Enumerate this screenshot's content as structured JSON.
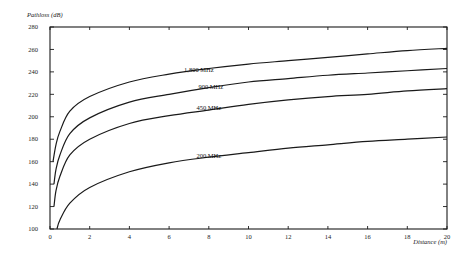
{
  "chart_data": {
    "type": "line",
    "title": "",
    "xlabel": "Distance (m)",
    "ylabel": "Pathloss (dB)",
    "xlim": [
      0,
      20
    ],
    "ylim": [
      100,
      280
    ],
    "x_ticks": [
      0,
      2,
      4,
      6,
      8,
      10,
      12,
      14,
      16,
      18,
      20
    ],
    "y_ticks": [
      100,
      120,
      140,
      160,
      180,
      200,
      220,
      240,
      260,
      280
    ],
    "grid": false,
    "legend": "inline-labels",
    "series": [
      {
        "name": "1,800 MHz",
        "x": [
          0.15,
          0.3,
          0.5,
          1,
          2,
          4,
          6,
          8,
          10,
          12,
          14,
          16,
          18,
          20
        ],
        "y": [
          160,
          175,
          187,
          205,
          218,
          231,
          238,
          243,
          247,
          250,
          253,
          256,
          259,
          261
        ]
      },
      {
        "name": "900 MHz",
        "x": [
          0.2,
          0.3,
          0.5,
          1,
          2,
          4,
          6,
          8,
          10,
          12,
          14,
          16,
          18,
          20
        ],
        "y": [
          140,
          153,
          166,
          185,
          199,
          213,
          220,
          226,
          231,
          234,
          237,
          239,
          241,
          243
        ]
      },
      {
        "name": "450 MHz",
        "x": [
          0.2,
          0.3,
          0.5,
          1,
          2,
          4,
          6,
          8,
          10,
          12,
          14,
          16,
          18,
          20
        ],
        "y": [
          120,
          134,
          147,
          166,
          180,
          194,
          201,
          206,
          211,
          215,
          218,
          220,
          223,
          225
        ]
      },
      {
        "name": "200 MHz",
        "x": [
          0.35,
          0.5,
          1,
          2,
          4,
          6,
          8,
          10,
          12,
          14,
          16,
          18,
          20
        ],
        "y": [
          100,
          108,
          123,
          137,
          151,
          159,
          164,
          168,
          172,
          175,
          178,
          180,
          182
        ]
      }
    ],
    "annotations": [
      {
        "text": "1,800 MHz",
        "x": 7.5,
        "y": 240
      },
      {
        "text": "900 MHz",
        "x": 8.1,
        "y": 225
      },
      {
        "text": "450 MHz",
        "x": 8.0,
        "y": 206
      },
      {
        "text": "200 MHz",
        "x": 8.0,
        "y": 163
      }
    ]
  }
}
